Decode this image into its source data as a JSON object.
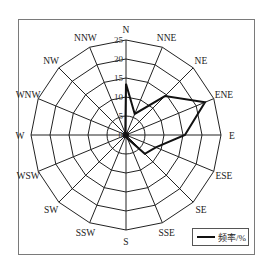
{
  "chart_data": {
    "type": "radar",
    "title": "",
    "categories": [
      "N",
      "NNE",
      "NE",
      "ENE",
      "E",
      "ESE",
      "SE",
      "SSE",
      "S",
      "SSW",
      "SW",
      "WSW",
      "W",
      "WNW",
      "NW",
      "NNW"
    ],
    "series": [
      {
        "name": "频率/%",
        "values": [
          13.5,
          6,
          14.5,
          22.5,
          15.5,
          8.5,
          7,
          1,
          0.5,
          0.5,
          0.5,
          0.5,
          0.5,
          0.5,
          0.5,
          0.5
        ]
      }
    ],
    "radial_ticks": [
      "0",
      "5",
      "10",
      "15",
      "20",
      "25"
    ],
    "radial_range": [
      0,
      25
    ],
    "grid": true,
    "legend_position": "bottom-right"
  },
  "legend": {
    "label": "频率/%"
  },
  "colors": {
    "line": "#111111",
    "grid": "#222222",
    "frame": "#7a7a7a"
  }
}
